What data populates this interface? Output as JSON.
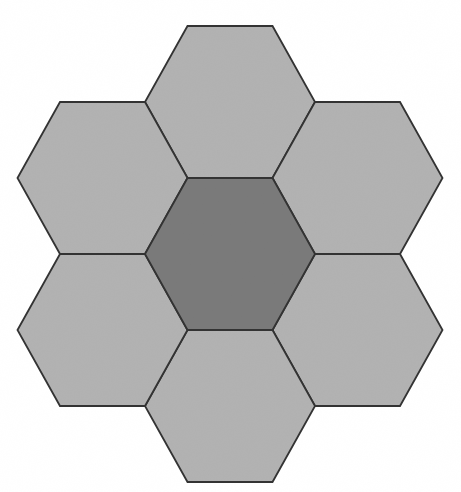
{
  "figure": {
    "canvas": {
      "width": 461,
      "height": 492,
      "background": "#ffffff"
    },
    "geometry": {
      "orientation": "flat-top",
      "hex_width_point_to_point": 170,
      "hex_height_flat_to_flat": 152,
      "center_x": 230,
      "center_y": 254,
      "neighbor_dx": 127.5,
      "neighbor_dy": 76
    },
    "style": {
      "stroke_color": "#333333",
      "stroke_width": 1.8,
      "center_fill": "#7a7a7a",
      "outer_fill": "#b2b2b2",
      "texture": "fine-grain-noise"
    },
    "cells": [
      {
        "id": "hex-north",
        "label": "North hexagon",
        "role": "outer",
        "cx": 230,
        "cy": 102,
        "fill": "#b2b2b2"
      },
      {
        "id": "hex-northeast",
        "label": "Northeast hexagon",
        "role": "outer",
        "cx": 357.5,
        "cy": 178,
        "fill": "#b2b2b2"
      },
      {
        "id": "hex-southeast",
        "label": "Southeast hexagon",
        "role": "outer",
        "cx": 357.5,
        "cy": 330,
        "fill": "#b2b2b2"
      },
      {
        "id": "hex-south",
        "label": "South hexagon",
        "role": "outer",
        "cx": 230,
        "cy": 406,
        "fill": "#b2b2b2"
      },
      {
        "id": "hex-southwest",
        "label": "Southwest hexagon",
        "role": "outer",
        "cx": 102.5,
        "cy": 330,
        "fill": "#b2b2b2"
      },
      {
        "id": "hex-northwest",
        "label": "Northwest hexagon",
        "role": "outer",
        "cx": 102.5,
        "cy": 178,
        "fill": "#b2b2b2"
      },
      {
        "id": "hex-center",
        "label": "Center hexagon",
        "role": "center",
        "cx": 230,
        "cy": 254,
        "fill": "#7a7a7a"
      }
    ]
  }
}
